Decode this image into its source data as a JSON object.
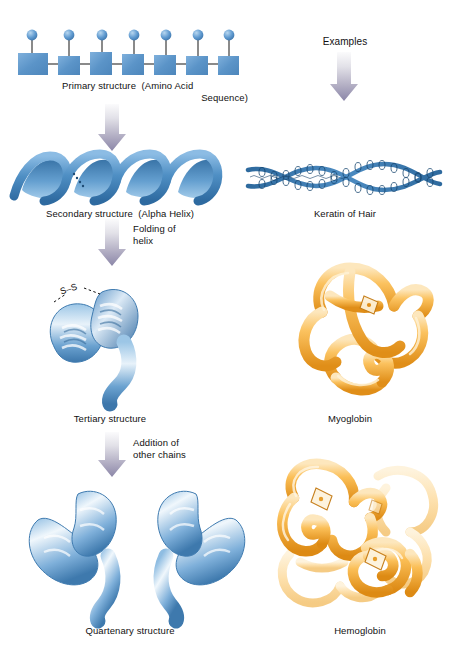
{
  "figure": {
    "palette": {
      "protein_blue_dark": "#2e6da4",
      "protein_blue_mid": "#5b9bd5",
      "protein_blue_light": "#cfe4f5",
      "protein_orange_dark": "#e8941f",
      "protein_orange_mid": "#f6b43f",
      "protein_orange_light": "#fde2b0",
      "arrow_top": "#f2f2f4",
      "arrow_bottom": "#8b86a8",
      "square_blue": "#5b94c8",
      "text": "#111111",
      "background": "#ffffff"
    }
  },
  "columns": {
    "left_header": "",
    "right_header": "Examples"
  },
  "arrows": [
    {
      "id": "arrow-primary-to-secondary",
      "caption": ""
    },
    {
      "id": "arrow-examples",
      "caption": ""
    },
    {
      "id": "arrow-secondary-to-tertiary",
      "caption": "Folding of\nhelix"
    },
    {
      "id": "arrow-tertiary-to-quaternary",
      "caption": "Addition of\nother chains"
    }
  ],
  "levels": [
    {
      "id": "primary",
      "label_line1": "Primary structure  (Amino Acid",
      "label_line2": "Sequence)",
      "example_label": "",
      "residue_count": 7,
      "graphic": "amino-acid-chain"
    },
    {
      "id": "secondary",
      "label_line1": "Secondary structure  (Alpha Helix)",
      "label_line2": "",
      "example_label": "Keratin of Hair",
      "graphic": "alpha-helix-ribbon"
    },
    {
      "id": "tertiary",
      "label_line1": "Tertiary structure",
      "label_line2": "",
      "example_label": "Myoglobin",
      "graphic": "folded-chain",
      "bond_label": "S–S"
    },
    {
      "id": "quaternary",
      "label_line1": "Quartenary structure",
      "label_line2": "",
      "example_label": "Hemoglobin",
      "graphic": "multi-subunit",
      "subunit_count": 2
    }
  ]
}
